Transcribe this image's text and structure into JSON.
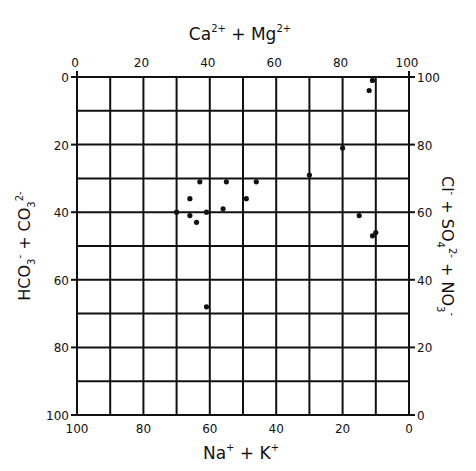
{
  "chart_data": {
    "type": "scatter",
    "title": "",
    "top_axis_label": "Ca2+ + Mg2+",
    "bottom_axis_label": "Na+ + K+",
    "left_axis_label": "HCO3- + CO3 2-",
    "right_axis_label": "Cl- + SO4 2- + NO3-",
    "top_ticks": [
      "0",
      "20",
      "40",
      "60",
      "80",
      "100"
    ],
    "bottom_ticks": [
      "100",
      "80",
      "60",
      "40",
      "20",
      "0"
    ],
    "left_ticks": [
      "0",
      "20",
      "40",
      "60",
      "80",
      "100"
    ],
    "right_ticks": [
      "100",
      "80",
      "60",
      "40",
      "20",
      "0"
    ],
    "xlim": [
      0,
      100
    ],
    "ylim": [
      0,
      100
    ],
    "grid": true,
    "grid_step": 10,
    "xlabel": "Ca2+ + Mg2+ (%) / Na+ + K+ (%)",
    "ylabel": "HCO3- + CO3 2- (%) / Cl- + SO4 2- + NO3- (%)",
    "points": [
      {
        "ca_mg": 89,
        "hco3_co3": 1
      },
      {
        "ca_mg": 88,
        "hco3_co3": 4
      },
      {
        "ca_mg": 80,
        "hco3_co3": 21
      },
      {
        "ca_mg": 70,
        "hco3_co3": 29
      },
      {
        "ca_mg": 85,
        "hco3_co3": 41
      },
      {
        "ca_mg": 90,
        "hco3_co3": 46
      },
      {
        "ca_mg": 89,
        "hco3_co3": 47
      },
      {
        "ca_mg": 54,
        "hco3_co3": 31
      },
      {
        "ca_mg": 51,
        "hco3_co3": 36
      },
      {
        "ca_mg": 45,
        "hco3_co3": 31
      },
      {
        "ca_mg": 44,
        "hco3_co3": 39
      },
      {
        "ca_mg": 37,
        "hco3_co3": 31
      },
      {
        "ca_mg": 34,
        "hco3_co3": 36
      },
      {
        "ca_mg": 30,
        "hco3_co3": 40
      },
      {
        "ca_mg": 34,
        "hco3_co3": 41
      },
      {
        "ca_mg": 36,
        "hco3_co3": 43
      },
      {
        "ca_mg": 39,
        "hco3_co3": 40
      },
      {
        "ca_mg": 39,
        "hco3_co3": 68
      }
    ]
  }
}
